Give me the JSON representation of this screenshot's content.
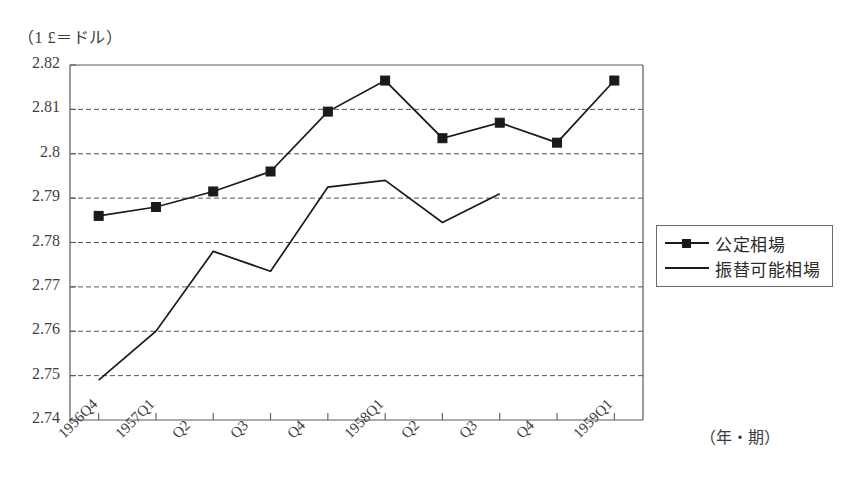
{
  "figure": {
    "y_unit_label": "（1 £＝ドル）",
    "x_unit_label": "（年・期）"
  },
  "legend": {
    "position": "right-middle",
    "items": [
      {
        "label": "公定相場",
        "marker": "square",
        "style": "line-with-square-marker"
      },
      {
        "label": "振替可能相場",
        "marker": "none",
        "style": "plain-line"
      }
    ]
  },
  "chart_data": {
    "type": "line",
    "title": "",
    "subtitle": "",
    "xlabel": "（年・期）",
    "ylabel": "（1 £＝ドル）",
    "categories": [
      "1956Q4",
      "1957Q1",
      "Q2",
      "Q3",
      "Q4",
      "1958Q1",
      "Q2",
      "Q3",
      "Q4",
      "1959Q1"
    ],
    "ylim": [
      2.74,
      2.82
    ],
    "ytick_labels": [
      "2.82",
      "2.81",
      "2.8",
      "2.79",
      "2.78",
      "2.77",
      "2.76",
      "2.75",
      "2.74"
    ],
    "ytick_values": [
      2.82,
      2.81,
      2.8,
      2.79,
      2.78,
      2.77,
      2.76,
      2.75,
      2.74
    ],
    "ytick_step": 0.01,
    "grid": true,
    "grid_style": "dashed-horizontal",
    "legend_position": "right",
    "series": [
      {
        "name": "公定相場",
        "marker": "square",
        "color": "#1a1a1a",
        "values": [
          2.786,
          2.788,
          2.7915,
          2.796,
          2.8095,
          2.8165,
          2.8035,
          2.807,
          2.8025,
          2.8165
        ]
      },
      {
        "name": "振替可能相場",
        "marker": "none",
        "color": "#1a1a1a",
        "values": [
          2.749,
          2.76,
          2.778,
          2.7735,
          2.7925,
          2.794,
          2.7845,
          2.791,
          null,
          null
        ]
      }
    ]
  }
}
